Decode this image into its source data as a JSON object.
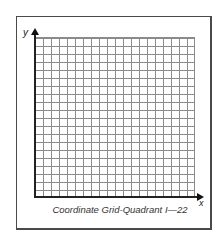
{
  "diagram": {
    "type": "coordinate-grid",
    "caption": "Coordinate Grid-Quadrant I—22",
    "axes": {
      "x_label": "x",
      "y_label": "y"
    },
    "grid": {
      "columns": 20,
      "rows": 20,
      "quadrant": "I"
    },
    "colors": {
      "frame": "#4a4a4a",
      "grid_lines": "#8a8a8a",
      "axes": "#222222",
      "background": "#ffffff"
    }
  }
}
